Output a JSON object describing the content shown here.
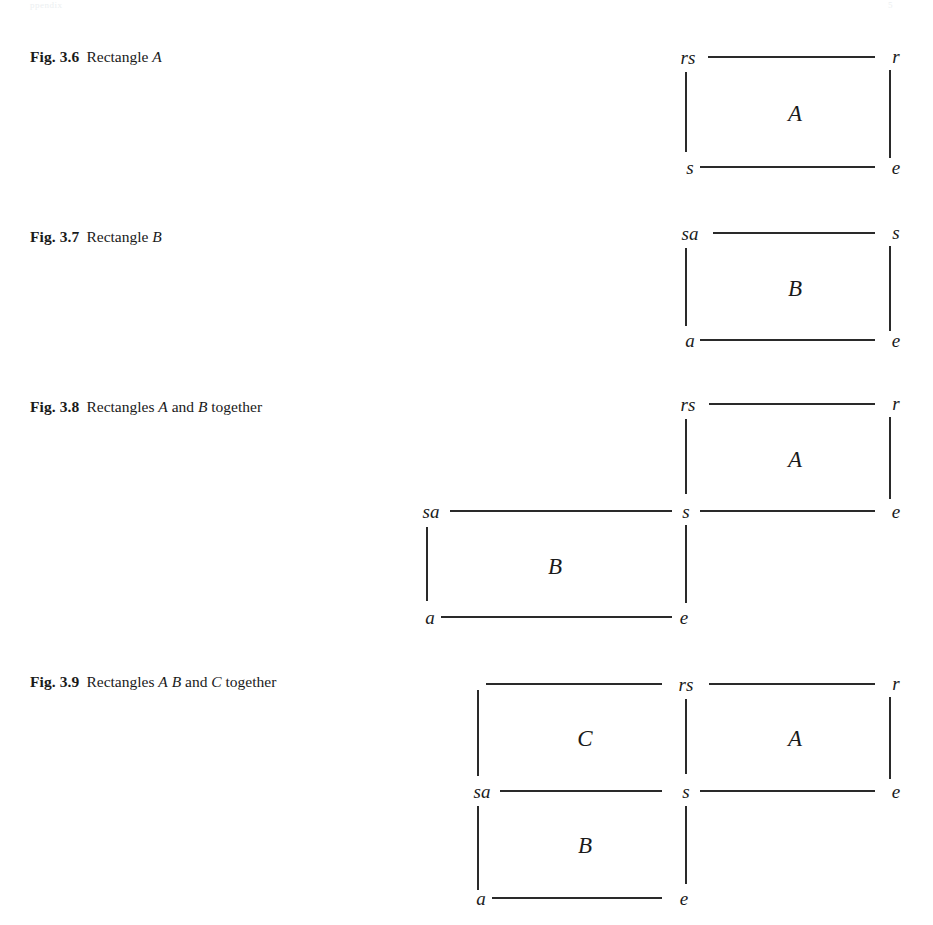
{
  "page": {
    "header_left": "ppendix",
    "header_right": "5",
    "background": "#ffffff",
    "ink": "#2a2a2a"
  },
  "figures": [
    {
      "id": "fig-3-6",
      "number": "Fig. 3.6",
      "title_lines": [
        "Rectangle A"
      ],
      "caption_parts": [
        {
          "text": "Rectangles",
          "italic": false
        },
        {
          "text": "A",
          "italic": true
        }
      ],
      "plain_caption": "Rectangle A",
      "regions": [
        {
          "name": "A",
          "label": "A"
        }
      ],
      "vertices": [
        {
          "name": "top-left",
          "label": "rs"
        },
        {
          "name": "top-right",
          "label": "r"
        },
        {
          "name": "bottom-left",
          "label": "s"
        },
        {
          "name": "bottom-right",
          "label": "e"
        }
      ]
    },
    {
      "id": "fig-3-7",
      "number": "Fig. 3.7",
      "title_lines": [
        "Rectangle B"
      ],
      "plain_caption": "Rectangle B",
      "regions": [
        {
          "name": "B",
          "label": "B"
        }
      ],
      "vertices": [
        {
          "name": "top-left",
          "label": "sa"
        },
        {
          "name": "top-right",
          "label": "s"
        },
        {
          "name": "bottom-left",
          "label": "a"
        },
        {
          "name": "bottom-right",
          "label": "e"
        }
      ]
    },
    {
      "id": "fig-3-8",
      "number": "Fig. 3.8",
      "title_lines": [
        "Rectangles A and",
        "B together"
      ],
      "plain_caption": "Rectangles A and B together",
      "regions": [
        {
          "name": "A",
          "label": "A"
        },
        {
          "name": "B",
          "label": "B"
        }
      ],
      "vertices": [
        {
          "name": "a-top-left",
          "label": "rs"
        },
        {
          "name": "a-top-right",
          "label": "r"
        },
        {
          "name": "shared-center",
          "label": "s"
        },
        {
          "name": "a-bottom-right",
          "label": "e"
        },
        {
          "name": "b-top-left",
          "label": "sa"
        },
        {
          "name": "b-bottom-left",
          "label": "a"
        },
        {
          "name": "b-bottom-right",
          "label": "e"
        }
      ]
    },
    {
      "id": "fig-3-9",
      "number": "Fig. 3.9",
      "title_lines": [
        "Rectangles A B",
        "and C together"
      ],
      "plain_caption": "Rectangles A B and C together",
      "regions": [
        {
          "name": "C",
          "label": "C"
        },
        {
          "name": "A",
          "label": "A"
        },
        {
          "name": "B",
          "label": "B"
        }
      ],
      "vertices": [
        {
          "name": "c-top-left",
          "label": ""
        },
        {
          "name": "top-center",
          "label": "rs"
        },
        {
          "name": "a-top-right",
          "label": "r"
        },
        {
          "name": "mid-left",
          "label": "sa"
        },
        {
          "name": "mid-center",
          "label": "s"
        },
        {
          "name": "mid-right",
          "label": "e"
        },
        {
          "name": "b-bottom-left",
          "label": "a"
        },
        {
          "name": "b-bottom-right",
          "label": "e"
        }
      ]
    }
  ],
  "captions": {
    "f36_num": "Fig. 3.6",
    "f36_t1": "Rectangle",
    "f36_t1i": "A",
    "f37_num": "Fig. 3.7",
    "f37_t1": "Rectangle",
    "f37_t1i": "B",
    "f38_num": "Fig. 3.8",
    "f38_t1": "Rectangles",
    "f38_t1i": "A",
    "f38_t2": "and",
    "f38_t3i": "B",
    "f38_t4": "together",
    "f39_num": "Fig. 3.9",
    "f39_t1": "Rectangles",
    "f39_t1i": "A",
    "f39_t2i": "B",
    "f39_t3": "and",
    "f39_t4i": "C",
    "f39_t5": "together"
  },
  "labels": {
    "rs": "rs",
    "r": "r",
    "s": "s",
    "e": "e",
    "sa": "sa",
    "a": "a",
    "A": "A",
    "B": "B",
    "C": "C",
    "blank": ""
  }
}
